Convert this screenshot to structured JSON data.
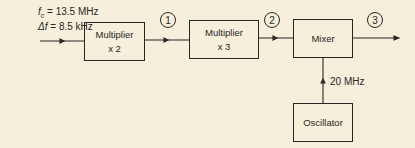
{
  "input": {
    "fc_symbol": "f",
    "fc_sub": "c",
    "fc_value": " = 13.5 MHz",
    "df_symbol": "Δf",
    "df_value": " = 8.5 kHz"
  },
  "blocks": {
    "mult2": {
      "title": "Multiplier",
      "factor": "x 2"
    },
    "mult3": {
      "title": "Multiplier",
      "factor": "x 3"
    },
    "mixer": {
      "title": "Mixer"
    },
    "oscillator": {
      "title": "Oscillator"
    }
  },
  "oscillator_freq": "20 MHz",
  "nodes": [
    "1",
    "2",
    "3"
  ]
}
